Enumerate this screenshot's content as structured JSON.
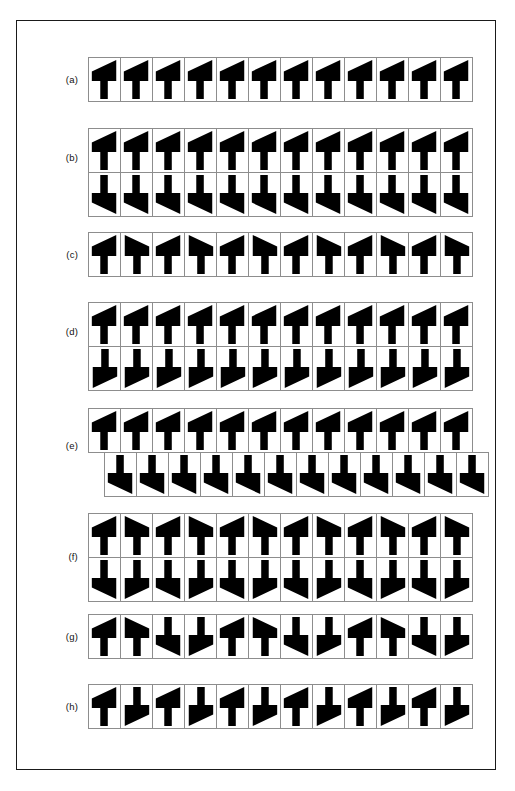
{
  "figure": {
    "page_width": 515,
    "page_height": 791,
    "background_color": "#ffffff",
    "motif_fill_color": "#000000",
    "cell_border_color": "#8d8d8d",
    "frame_color": "#1a1a1a",
    "cell_width": 33,
    "cell_height": 45,
    "motif_polygon": "M 3,24 L 3,14 L 29,2 L 29,24 L 20,24 L 20,43 L 12,43 L 12,24 Z",
    "motif_description": "leftward-leaning triangular flag on a vertical stem"
  },
  "rows": [
    {
      "id": "a",
      "label": "(a)",
      "symmetry": "translation only",
      "left": 88,
      "top": 57,
      "label_top": 74,
      "strips": [
        {
          "offset": false,
          "cells": [
            "identity",
            "identity",
            "identity",
            "identity",
            "identity",
            "identity",
            "identity",
            "identity",
            "identity",
            "identity",
            "identity",
            "identity"
          ]
        }
      ]
    },
    {
      "id": "b",
      "label": "(b)",
      "symmetry": "horizontal mirror line",
      "left": 88,
      "top": 128,
      "label_top": 152,
      "strips": [
        {
          "offset": false,
          "cells": [
            "identity",
            "identity",
            "identity",
            "identity",
            "identity",
            "identity",
            "identity",
            "identity",
            "identity",
            "identity",
            "identity",
            "identity"
          ]
        },
        {
          "offset": false,
          "cells": [
            "mirror-v",
            "mirror-v",
            "mirror-v",
            "mirror-v",
            "mirror-v",
            "mirror-v",
            "mirror-v",
            "mirror-v",
            "mirror-v",
            "mirror-v",
            "mirror-v",
            "mirror-v"
          ]
        }
      ]
    },
    {
      "id": "c",
      "label": "(c)",
      "symmetry": "vertical mirror lines",
      "left": 88,
      "top": 232,
      "label_top": 249,
      "strips": [
        {
          "offset": false,
          "cells": [
            "identity",
            "mirror-h",
            "identity",
            "mirror-h",
            "identity",
            "mirror-h",
            "identity",
            "mirror-h",
            "identity",
            "mirror-h",
            "identity",
            "mirror-h"
          ]
        }
      ]
    },
    {
      "id": "d",
      "label": "(d)",
      "symmetry": "two-fold rotation centres",
      "left": 88,
      "top": 302,
      "label_top": 326,
      "strips": [
        {
          "offset": false,
          "cells": [
            "identity",
            "identity",
            "identity",
            "identity",
            "identity",
            "identity",
            "identity",
            "identity",
            "identity",
            "identity",
            "identity",
            "identity"
          ]
        },
        {
          "offset": false,
          "cells": [
            "rot180",
            "rot180",
            "rot180",
            "rot180",
            "rot180",
            "rot180",
            "rot180",
            "rot180",
            "rot180",
            "rot180",
            "rot180",
            "rot180"
          ]
        }
      ]
    },
    {
      "id": "e",
      "label": "(e)",
      "symmetry": "glide reflection",
      "left": 88,
      "top": 408,
      "label_top": 440,
      "strips": [
        {
          "offset": false,
          "cells": [
            "identity",
            "identity",
            "identity",
            "identity",
            "identity",
            "identity",
            "identity",
            "identity",
            "identity",
            "identity",
            "identity",
            "identity"
          ]
        },
        {
          "offset": true,
          "cells": [
            "mirror-v",
            "mirror-v",
            "mirror-v",
            "mirror-v",
            "mirror-v",
            "mirror-v",
            "mirror-v",
            "mirror-v",
            "mirror-v",
            "mirror-v",
            "mirror-v",
            "mirror-v"
          ]
        }
      ]
    },
    {
      "id": "f",
      "label": "(f)",
      "symmetry": "vertical and horizontal mirrors",
      "left": 88,
      "top": 513,
      "label_top": 551,
      "strips": [
        {
          "offset": false,
          "cells": [
            "identity",
            "mirror-h",
            "identity",
            "mirror-h",
            "identity",
            "mirror-h",
            "identity",
            "mirror-h",
            "identity",
            "mirror-h",
            "identity",
            "mirror-h"
          ]
        },
        {
          "offset": false,
          "cells": [
            "mirror-v",
            "rot180",
            "mirror-v",
            "rot180",
            "mirror-v",
            "rot180",
            "mirror-v",
            "rot180",
            "mirror-v",
            "rot180",
            "mirror-v",
            "rot180"
          ]
        }
      ]
    },
    {
      "id": "g",
      "label": "(g)",
      "symmetry": "vertical mirrors with glide",
      "left": 88,
      "top": 614,
      "label_top": 631,
      "strips": [
        {
          "offset": false,
          "cells": [
            "identity",
            "mirror-h",
            "mirror-v",
            "rot180",
            "identity",
            "mirror-h",
            "mirror-v",
            "rot180",
            "identity",
            "mirror-h",
            "mirror-v",
            "rot180"
          ]
        }
      ]
    },
    {
      "id": "h",
      "label": "(h)",
      "symmetry": "two-fold rotation only",
      "left": 88,
      "top": 684,
      "label_top": 701,
      "strips": [
        {
          "offset": false,
          "cells": [
            "identity",
            "rot180",
            "identity",
            "rot180",
            "identity",
            "rot180",
            "identity",
            "rot180",
            "identity",
            "rot180",
            "identity",
            "rot180"
          ]
        }
      ]
    }
  ]
}
